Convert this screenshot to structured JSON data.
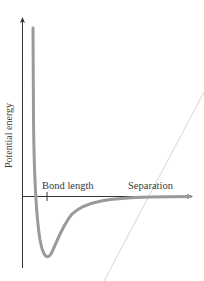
{
  "diagram": {
    "title": "",
    "y_axis_label": "Potential energy",
    "x_axis_label": "Separation",
    "tick_label": "Bond length",
    "curve": {
      "type": "potential-well",
      "color": "#9a9a9a",
      "description": "Lennard-Jones-like potential energy curve vs separation; steep repulsive wall at small separation, minimum at bond length, approaches zero at large separation"
    },
    "diagonal_line": {
      "color": "#d4d4d4",
      "description": "faint diagonal guide line crossing the x-axis near the Separation label"
    },
    "colors": {
      "axes": "#333333",
      "curve": "#9a9a9a",
      "text": "#3a3a3a",
      "background": "#ffffff"
    }
  }
}
